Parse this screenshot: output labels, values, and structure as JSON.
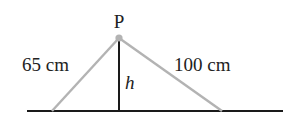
{
  "diagram": {
    "point_label": "P",
    "left_length_label": "65 cm",
    "right_length_label": "100 cm",
    "height_label": "h",
    "colors": {
      "string": "#b3b3b3",
      "ground": "#1a1a1a",
      "height_line": "#1a1a1a",
      "point": "#b3b3b3",
      "text": "#222222"
    }
  }
}
